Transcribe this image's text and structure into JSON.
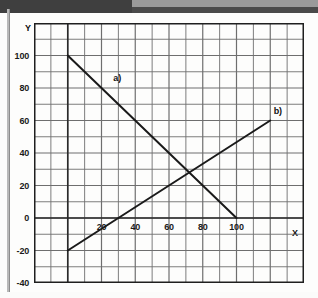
{
  "figure": {
    "axis_x_name": "X",
    "axis_y_name": "Y"
  },
  "chart_data": {
    "type": "line",
    "title": "",
    "subtitle": "",
    "xlabel": "X",
    "ylabel": "Y",
    "xlim": [
      -20,
      140
    ],
    "ylim": [
      -40,
      120
    ],
    "xticks": [
      20,
      40,
      60,
      80,
      100
    ],
    "yticks": [
      100,
      80,
      60,
      40,
      20,
      0,
      -20,
      -40
    ],
    "xtick_labels": [
      "20",
      "40",
      "60",
      "80",
      "100"
    ],
    "ytick_labels": [
      "100",
      "80",
      "60",
      "40",
      "20",
      "0",
      "-20",
      "-40"
    ],
    "grid": true,
    "grid_step_x": 10,
    "grid_step_y": 10,
    "legend": "inline-annotations",
    "series": [
      {
        "name": "a)",
        "label": "a)",
        "label_x": 27,
        "label_y": 86,
        "color": "#1a1a1a",
        "points": [
          [
            0,
            100
          ],
          [
            100,
            0
          ]
        ],
        "slope": -1,
        "intercept": 100
      },
      {
        "name": "b)",
        "label": "b)",
        "label_x": 122,
        "label_y": 66,
        "color": "#1a1a1a",
        "points": [
          [
            0,
            -20
          ],
          [
            120,
            60
          ]
        ],
        "slope": 0.6667,
        "intercept": -20
      }
    ],
    "annotations": [
      {
        "text": "intersection",
        "x": 80,
        "y": 20,
        "visible": false
      }
    ]
  },
  "colors": {
    "grid_line": "#6e6e6e",
    "frame": "#1f1f1f",
    "curve": "#1a1a1a",
    "scan_band": "#3f3f3f",
    "page": "#fdfdfc"
  }
}
